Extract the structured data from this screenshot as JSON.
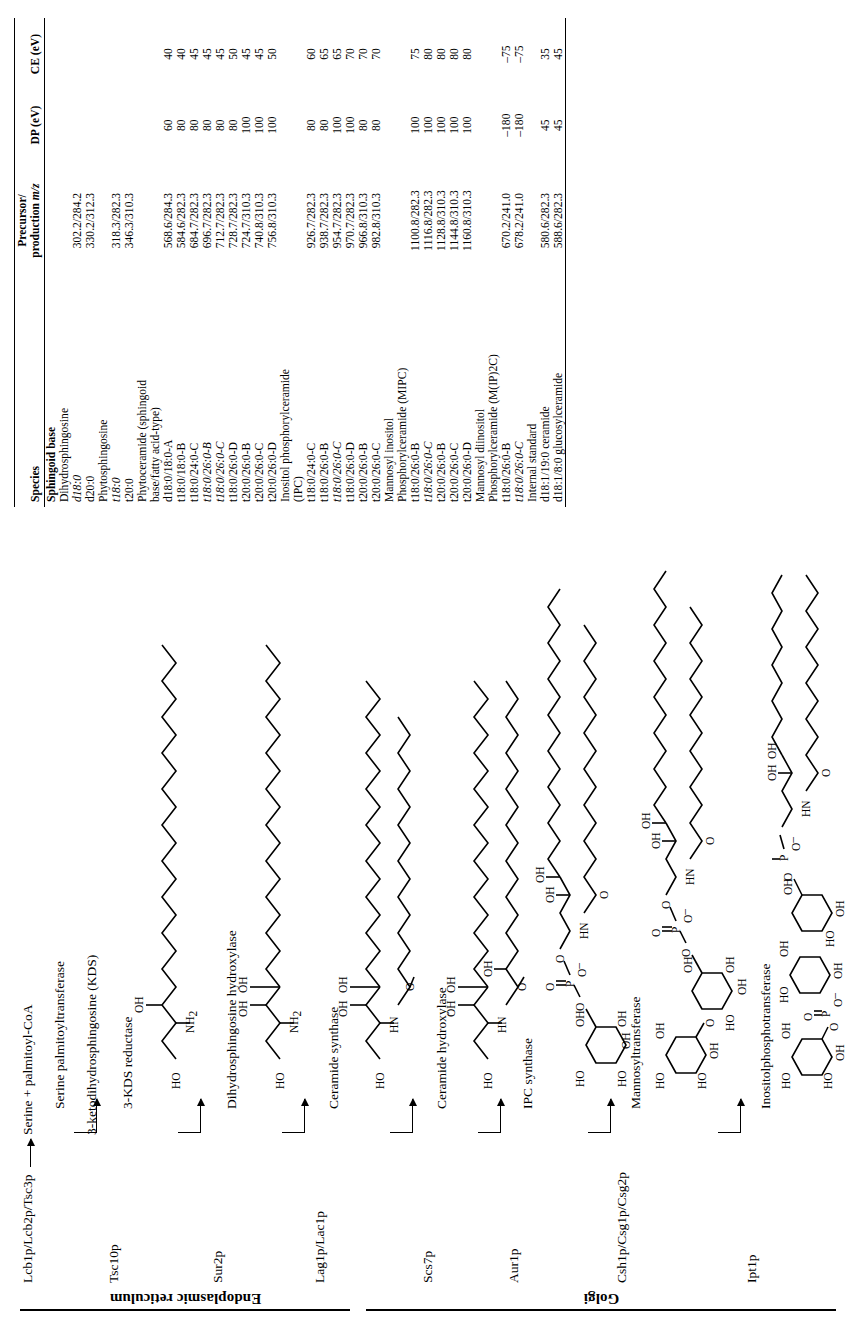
{
  "figure": {
    "orientation": "rotated-90-ccw"
  },
  "compartments": [
    {
      "name": "endoplasmic-reticulum",
      "label": "Endoplasmic reticulum"
    },
    {
      "name": "golgi",
      "label": "Golgi"
    }
  ],
  "pathway": {
    "genes": [
      "Lcb1p/Lcb2p/Tsc3p",
      "Tsc10p",
      "Sur2p",
      "Lag1p/Lac1p",
      "Scs7p",
      "Aur1p",
      "Csh1p/Csg1p/Csg2p",
      "Ipt1p"
    ],
    "metabolites": [
      "Serine + palmitoyl-CoA",
      "3-ketodihydrosphingosine (KDS)"
    ],
    "enzymes": [
      "Serine palmitoyltransferase",
      "3-KDS reductase",
      "Dihydrosphingosine hydroxylase",
      "Ceramide synthase",
      "Ceramide hydroxylase",
      "IPC synthase",
      "Mannosyltransferase",
      "Inositolphosphotransferase"
    ],
    "structure_labels": {
      "oh": "OH",
      "ho": "HO",
      "nh2": "NH",
      "nh2_sub": "2",
      "hn": "HN",
      "o": "O",
      "p": "P",
      "minus": "–"
    }
  },
  "table": {
    "headers": {
      "species": "Species",
      "precursor": "Precursor/",
      "precursor_2": "production ",
      "precursor_mz": "m/z",
      "dp": "DP (eV)",
      "ce": "CE (eV)"
    },
    "rows": [
      {
        "species": "Sphingoid base",
        "style": "group",
        "mz": "",
        "dp": "",
        "ce": ""
      },
      {
        "species": "Dihydrosphingosine",
        "style": "plain",
        "mz": "",
        "dp": "",
        "ce": ""
      },
      {
        "species": "d18:0",
        "style": "italic",
        "mz": "302.2/284.2",
        "dp": "",
        "ce": ""
      },
      {
        "species": "d20:0",
        "style": "plain",
        "mz": "330.2/312.3",
        "dp": "",
        "ce": ""
      },
      {
        "species": "Phytosphingosine",
        "style": "plain",
        "mz": "",
        "dp": "",
        "ce": ""
      },
      {
        "species": "t18:0",
        "style": "italic",
        "mz": "318.3/282.3",
        "dp": "",
        "ce": ""
      },
      {
        "species": "t20:0",
        "style": "plain",
        "mz": "346.3/310.3",
        "dp": "",
        "ce": ""
      },
      {
        "species": "Phytoceramide (sphingoid",
        "style": "plain",
        "mz": "",
        "dp": "",
        "ce": ""
      },
      {
        "species": "base/fatty acid-type)",
        "style": "plain",
        "mz": "",
        "dp": "",
        "ce": ""
      },
      {
        "species": "d18:0/18:0-A",
        "style": "plain",
        "mz": "568.6/284.3",
        "dp": "60",
        "ce": "40"
      },
      {
        "species": "t18:0/18:0-B",
        "style": "plain",
        "mz": "584.6/282.3",
        "dp": "80",
        "ce": "40"
      },
      {
        "species": "t18:0/24:0-C",
        "style": "plain",
        "mz": "684.7/282.3",
        "dp": "80",
        "ce": "45"
      },
      {
        "species": "t18:0/26:0-B",
        "style": "italic",
        "mz": "696.7/282.3",
        "dp": "80",
        "ce": "45"
      },
      {
        "species": "t18:0/26:0-C",
        "style": "italic",
        "mz": "712.7/282.3",
        "dp": "80",
        "ce": "45"
      },
      {
        "species": "t18:0/26:0-D",
        "style": "plain",
        "mz": "728.7/282.3",
        "dp": "80",
        "ce": "50"
      },
      {
        "species": "t20:0/26:0-B",
        "style": "plain",
        "mz": "724.7/310.3",
        "dp": "100",
        "ce": "45"
      },
      {
        "species": "t20:0/26:0-C",
        "style": "plain",
        "mz": "740.8/310.3",
        "dp": "100",
        "ce": "45"
      },
      {
        "species": "t20:0/26:0-D",
        "style": "plain",
        "mz": "756.8/310.3",
        "dp": "100",
        "ce": "50"
      },
      {
        "species": "Inositol phosphorylceramide",
        "style": "plain",
        "mz": "",
        "dp": "",
        "ce": ""
      },
      {
        "species": "(IPC)",
        "style": "plain",
        "mz": "",
        "dp": "",
        "ce": ""
      },
      {
        "species": "t18:0/24:0-C",
        "style": "plain",
        "mz": "926.7/282.3",
        "dp": "80",
        "ce": "60"
      },
      {
        "species": "t18:0/26:0-B",
        "style": "plain",
        "mz": "938.7/282.3",
        "dp": "80",
        "ce": "65"
      },
      {
        "species": "t18:0/26:0-C",
        "style": "italic",
        "mz": "954.7/282.3",
        "dp": "100",
        "ce": "65"
      },
      {
        "species": "t18:0/26:0-D",
        "style": "plain",
        "mz": "970.7/282.3",
        "dp": "100",
        "ce": "70"
      },
      {
        "species": "t20:0/26:0-B",
        "style": "plain",
        "mz": "966.8/310.3",
        "dp": "80",
        "ce": "70"
      },
      {
        "species": "t20:0/26:0-C",
        "style": "plain",
        "mz": "982.8/310.3",
        "dp": "80",
        "ce": "70"
      },
      {
        "species": "Mannosyl inositol",
        "style": "plain",
        "mz": "",
        "dp": "",
        "ce": ""
      },
      {
        "species": "Phosphorylceramide (MIPC)",
        "style": "plain",
        "mz": "",
        "dp": "",
        "ce": ""
      },
      {
        "species": "t18:0/26:0-B",
        "style": "plain",
        "mz": "1100.8/282.3",
        "dp": "100",
        "ce": "75"
      },
      {
        "species": "t18:0/26:0-C",
        "style": "italic",
        "mz": "1116.8/282.3",
        "dp": "100",
        "ce": "80"
      },
      {
        "species": "t20:0/26:0-B",
        "style": "plain",
        "mz": "1128.8/310.3",
        "dp": "100",
        "ce": "80"
      },
      {
        "species": "t20:0/26:0-C",
        "style": "plain",
        "mz": "1144.8/310.3",
        "dp": "100",
        "ce": "80"
      },
      {
        "species": "t20:0/26:0-D",
        "style": "plain",
        "mz": "1160.8/310.3",
        "dp": "100",
        "ce": "80"
      },
      {
        "species": "Mannosyl diinositol",
        "style": "plain",
        "mz": "",
        "dp": "",
        "ce": ""
      },
      {
        "species": "Phosphorylceramide (M(IP)2C)",
        "style": "plain",
        "mz": "",
        "dp": "",
        "ce": ""
      },
      {
        "species": "t18:0/26:0-B",
        "style": "plain",
        "mz": "670.2/241.0",
        "dp": "–180",
        "ce": "–75"
      },
      {
        "species": "t18:0/26:0-C",
        "style": "italic",
        "mz": "678.2/241.0",
        "dp": "–180",
        "ce": "–75"
      },
      {
        "species": "Internal standard",
        "style": "plain",
        "mz": "",
        "dp": "",
        "ce": ""
      },
      {
        "species": "d18:1/19:0 ceramide",
        "style": "plain",
        "mz": "580.6/282.3",
        "dp": "45",
        "ce": "35"
      },
      {
        "species": "d18:1/8:0 glucosylceramide",
        "style": "plain",
        "mz": "588.6/282.3",
        "dp": "45",
        "ce": "45"
      }
    ]
  }
}
